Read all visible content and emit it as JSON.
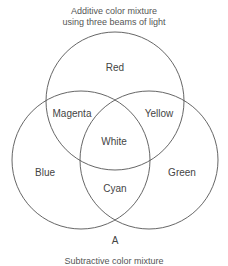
{
  "title": {
    "line1": "Additive color mixture",
    "line2": "using three beams of light"
  },
  "circles": {
    "top": {
      "label": "Red",
      "cx": 115,
      "cy": 101,
      "r": 69
    },
    "left": {
      "label": "Blue",
      "cx": 81,
      "cy": 160,
      "r": 69
    },
    "right": {
      "label": "Green",
      "cx": 149,
      "cy": 160,
      "r": 69
    }
  },
  "regions": {
    "red_blue": "Magenta",
    "red_green": "Yellow",
    "center": "White",
    "blue_green": "Cyan"
  },
  "point_label": "A",
  "caption": "Subtractive color mixture",
  "stroke_color": "#555555"
}
